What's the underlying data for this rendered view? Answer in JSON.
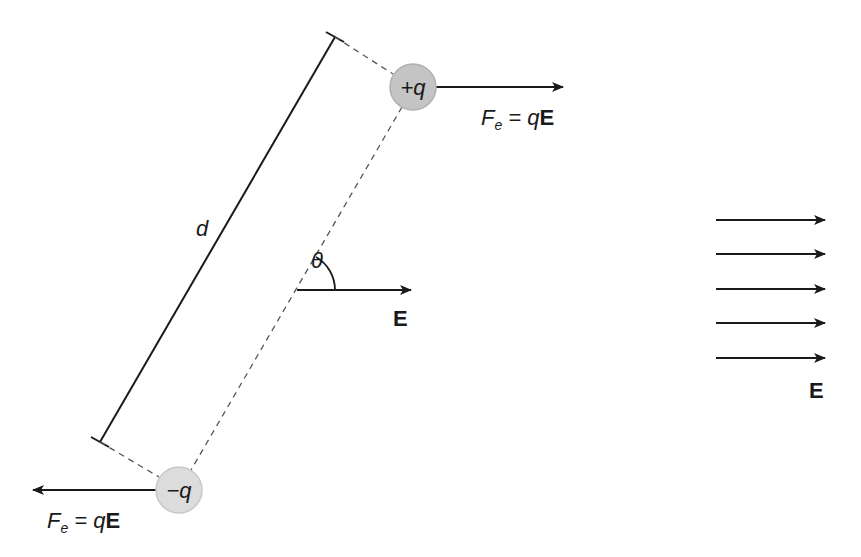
{
  "diagram": {
    "colors": {
      "line": "#1a1a1a",
      "dashed": "#555555",
      "positive_charge_fill": "#c4c4c4",
      "negative_charge_fill": "#dcdcdc",
      "charge_stroke": "#bdbdbd"
    },
    "positive_charge": {
      "label": "+q",
      "cx": 413,
      "cy": 87,
      "r": 23
    },
    "negative_charge": {
      "label": "−q",
      "cx": 179,
      "cy": 490,
      "r": 23
    },
    "force_positive": {
      "F": "F",
      "sub": "e",
      "eq": " = q",
      "vec": "E",
      "direction": "right"
    },
    "force_negative": {
      "F": "F",
      "sub": "e",
      "eq": " = q",
      "vec": "E",
      "direction": "left"
    },
    "separation_label": "d",
    "angle_label": "θ",
    "dipole_field_label": "E",
    "field_label": "E",
    "field_arrows_count": 5
  }
}
